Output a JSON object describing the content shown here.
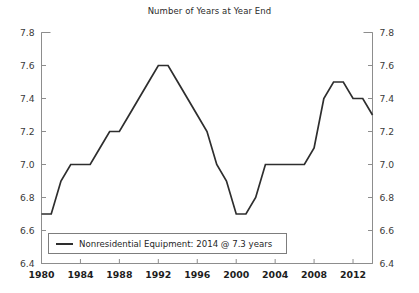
{
  "chart_data": {
    "type": "line",
    "title": "Number of Years at Year End",
    "xlabel": "",
    "ylabel": "",
    "xlim": [
      1980,
      2014
    ],
    "ylim": [
      6.4,
      7.8
    ],
    "grid": false,
    "legend_position": "bottom-left",
    "x_ticks": [
      1980,
      1984,
      1988,
      1992,
      1996,
      2000,
      2004,
      2008,
      2012
    ],
    "y_ticks": [
      "6.4",
      "6.6",
      "6.8",
      "7.0",
      "7.2",
      "7.4",
      "7.6",
      "7.8"
    ],
    "y_axis_right_ticks": [
      "6.4",
      "6.6",
      "6.8",
      "7.0",
      "7.2",
      "7.4",
      "7.6",
      "7.8"
    ],
    "series": [
      {
        "name": "Nonresidential Equipment: 2014 @ 7.3 years",
        "color": "#2e2e2e",
        "x": [
          1980,
          1981,
          1982,
          1983,
          1984,
          1985,
          1986,
          1987,
          1988,
          1989,
          1990,
          1991,
          1992,
          1993,
          1994,
          1995,
          1996,
          1997,
          1998,
          1999,
          2000,
          2001,
          2002,
          2003,
          2004,
          2005,
          2006,
          2007,
          2008,
          2009,
          2010,
          2011,
          2012,
          2013,
          2014
        ],
        "values": [
          6.7,
          6.7,
          6.9,
          7.0,
          7.0,
          7.0,
          7.1,
          7.2,
          7.2,
          7.3,
          7.4,
          7.5,
          7.6,
          7.6,
          7.5,
          7.4,
          7.3,
          7.2,
          7.0,
          6.9,
          6.7,
          6.7,
          6.8,
          7.0,
          7.0,
          7.0,
          7.0,
          7.0,
          7.1,
          7.4,
          7.5,
          7.5,
          7.4,
          7.4,
          7.3
        ]
      }
    ]
  },
  "legend": {
    "entry_label": "Nonresidential Equipment: 2014 @ 7.3 years"
  }
}
